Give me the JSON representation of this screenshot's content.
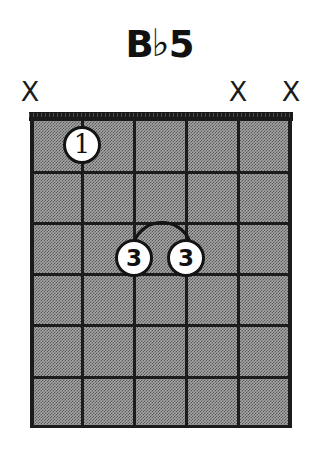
{
  "title": {
    "full": "Bb5",
    "root": "B",
    "accidental": "♭",
    "quality": "5"
  },
  "colors": {
    "ink": "#1a1a1a",
    "board_fill": "#a6a6a6",
    "dot_fill": "#ffffff",
    "background": "#ffffff"
  },
  "diagram": {
    "instrument": "guitar",
    "string_count": 6,
    "fret_count": 6,
    "starting_fret": 1,
    "nut_shown": true,
    "position_label": ""
  },
  "string_markers": [
    {
      "string": 1,
      "symbol": "X",
      "state": "muted",
      "x": 30
    },
    {
      "string": 2,
      "symbol": "",
      "state": "fretted",
      "x": 82
    },
    {
      "string": 3,
      "symbol": "",
      "state": "fretted",
      "x": 134
    },
    {
      "string": 4,
      "symbol": "",
      "state": "fretted",
      "x": 186
    },
    {
      "string": 5,
      "symbol": "X",
      "state": "muted",
      "x": 238
    },
    {
      "string": 6,
      "symbol": "X",
      "state": "muted",
      "x": 291
    }
  ],
  "finger_dots": [
    {
      "label": "1",
      "string": 2,
      "fret": 1,
      "x": 82,
      "y": 145
    },
    {
      "label": "3",
      "string": 3,
      "fret": 3,
      "x": 134,
      "y": 258
    },
    {
      "label": "3",
      "string": 4,
      "fret": 3,
      "x": 186,
      "y": 258
    }
  ],
  "barre": {
    "present": true,
    "finger": "3",
    "fret": 3,
    "from_string": 3,
    "to_string": 4,
    "x_start": 134,
    "x_end": 186,
    "peak_y": 216,
    "base_y": 240
  },
  "geometry": {
    "grid_left": 30,
    "grid_right": 291,
    "grid_top": 120,
    "grid_bottom": 428,
    "nut_top": 112,
    "string_x": [
      30,
      82,
      134,
      186,
      238,
      291
    ],
    "fret_y": [
      120,
      171,
      222,
      273,
      324,
      376,
      428
    ]
  }
}
